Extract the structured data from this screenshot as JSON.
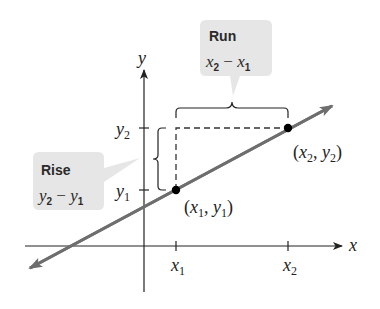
{
  "diagram": {
    "axes": {
      "x_label": "x",
      "y_label": "y",
      "x_ticks": [
        {
          "var": "x",
          "sub": "1"
        },
        {
          "var": "x",
          "sub": "2"
        }
      ],
      "y_ticks": [
        {
          "var": "y",
          "sub": "2"
        },
        {
          "var": "y",
          "sub": "1"
        }
      ]
    },
    "points": [
      {
        "open": "(",
        "a": "x",
        "a_sub": "1",
        "sep": ", ",
        "b": "y",
        "b_sub": "1",
        "close": ")"
      },
      {
        "open": "(",
        "a": "x",
        "a_sub": "2",
        "sep": ", ",
        "b": "y",
        "b_sub": "2",
        "close": ")"
      }
    ],
    "callouts": {
      "run": {
        "title": "Run",
        "a": "x",
        "a_sub": "2",
        "op": " − ",
        "b": "x",
        "b_sub": "1"
      },
      "rise": {
        "title": "Rise",
        "a": "y",
        "a_sub": "2",
        "op": " − ",
        "b": "y",
        "b_sub": "1"
      }
    },
    "colors": {
      "line": "#6e6e6e",
      "axis": "#222222",
      "callout_bg": "#e6e6e6",
      "point": "#000000"
    }
  }
}
